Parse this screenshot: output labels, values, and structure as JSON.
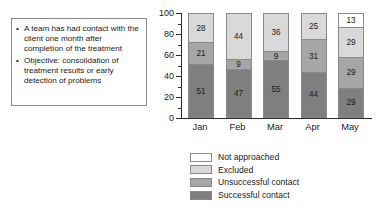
{
  "textbox": {
    "bullets": [
      "A team has had contact with the client one month after completion of the treatment",
      "Objective: consolidation of treatment results or early detection of problems"
    ],
    "bullet_marker": "•"
  },
  "chart_data": {
    "type": "bar",
    "subtype": "stacked",
    "title": "",
    "xlabel": "",
    "ylabel": "",
    "categories": [
      "Jan",
      "Feb",
      "Mar",
      "Apr",
      "May"
    ],
    "ylim": [
      0,
      100
    ],
    "yticks": [
      0,
      20,
      40,
      60,
      80,
      100
    ],
    "ytick_labels": [
      "0",
      "20",
      "40",
      "60",
      "80",
      "100"
    ],
    "yminor_step": 10,
    "grid": false,
    "legend_position": "below",
    "series": [
      {
        "name": "Successful contact",
        "color": "#7f7f7f",
        "values": [
          51,
          47,
          55,
          44,
          29
        ]
      },
      {
        "name": "Unsuccessful contact",
        "color": "#a6a6a6",
        "values": [
          21,
          9,
          9,
          31,
          29
        ]
      },
      {
        "name": "Excluded",
        "color": "#d9d9d9",
        "values": [
          28,
          44,
          36,
          25,
          29
        ]
      },
      {
        "name": "Not approached",
        "color": "#ffffff",
        "values": [
          0,
          0,
          0,
          0,
          13
        ]
      }
    ]
  },
  "legend": {
    "items": [
      {
        "label": "Not approached",
        "color": "#ffffff"
      },
      {
        "label": "Excluded",
        "color": "#d9d9d9"
      },
      {
        "label": "Unsuccessful contact",
        "color": "#a6a6a6"
      },
      {
        "label": "Successful contact",
        "color": "#7f7f7f"
      }
    ]
  }
}
